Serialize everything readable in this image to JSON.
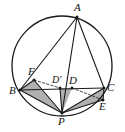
{
  "figure": {
    "kind": "geometry-diagram",
    "width": 125,
    "height": 132,
    "stroke_color": "#1a1a1a",
    "shade_color": "#9a9a9a",
    "background": "#ffffff"
  },
  "labels": {
    "A": "A",
    "B": "B",
    "C": "C",
    "D": "D",
    "D_prime": "D'",
    "E": "E",
    "F": "F",
    "P": "P"
  },
  "chart_data": {
    "type": "scatter",
    "xlabel": "",
    "ylabel": "",
    "xlim": [
      0,
      125
    ],
    "ylim": [
      0,
      132
    ],
    "grid": false,
    "legend": "none",
    "circle": {
      "cx": 62,
      "cy": 66,
      "r": 50
    },
    "points": [
      {
        "name": "A",
        "x": 77,
        "y": 17,
        "label": "A",
        "label_x": 74,
        "label_y": 4
      },
      {
        "name": "B",
        "x": 20,
        "y": 90,
        "label": "B",
        "label_x": 10,
        "label_y": 86
      },
      {
        "name": "C",
        "x": 104,
        "y": 88,
        "label": "C",
        "label_x": 107,
        "label_y": 84
      },
      {
        "name": "D",
        "x": 72,
        "y": 88,
        "label": "D",
        "label_x": 69,
        "label_y": 76
      },
      {
        "name": "D_prime",
        "x": 60,
        "y": 88,
        "label": "D'",
        "label_x": 54,
        "label_y": 76
      },
      {
        "name": "E",
        "x": 103,
        "y": 100,
        "label": "E",
        "label_x": 100,
        "label_y": 102
      },
      {
        "name": "F",
        "x": 34,
        "y": 80,
        "label": "F",
        "label_x": 29,
        "label_y": 67
      },
      {
        "name": "P",
        "x": 62,
        "y": 113,
        "label": "P",
        "label_x": 59,
        "label_y": 117
      }
    ],
    "solid_segments": [
      {
        "from": "A",
        "to": "B"
      },
      {
        "from": "A",
        "to": "C"
      },
      {
        "from": "A",
        "to": "P"
      },
      {
        "from": "B",
        "to": "C"
      },
      {
        "from": "B",
        "to": "P"
      },
      {
        "from": "P",
        "to": "C"
      },
      {
        "from": "B",
        "to": "F"
      },
      {
        "from": "F",
        "to": "P"
      },
      {
        "from": "P",
        "to": "E"
      },
      {
        "from": "E",
        "to": "C"
      },
      {
        "from": "P",
        "to": "D_prime"
      }
    ],
    "dashed_segments": [
      {
        "from": "F",
        "to": "D_prime"
      },
      {
        "from": "D",
        "to": "E"
      }
    ],
    "shaded_triangles": [
      {
        "name": "triangle-BFP",
        "vertices": [
          "B",
          "F",
          "P"
        ]
      },
      {
        "name": "triangle-D-prime-P",
        "vertices": [
          "D_prime",
          "D",
          "P"
        ]
      },
      {
        "name": "triangle-PCE",
        "vertices": [
          "P",
          "C",
          "E"
        ]
      }
    ]
  }
}
